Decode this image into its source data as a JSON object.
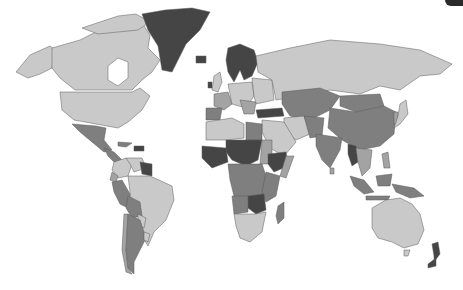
{
  "map": {
    "type": "choropleth world map",
    "colorscale": {
      "levels": [
        {
          "name": "level-1-lightest",
          "color": "#c9c9c9"
        },
        {
          "name": "level-2",
          "color": "#a3a3a3"
        },
        {
          "name": "level-3",
          "color": "#7f7f7f"
        },
        {
          "name": "level-4-darkest",
          "color": "#454545"
        }
      ],
      "ocean": "#ffffff",
      "border": "#5a5a5a"
    },
    "regions": [
      {
        "name": "Canada",
        "level": 1
      },
      {
        "name": "United States",
        "level": 1
      },
      {
        "name": "Alaska",
        "level": 1
      },
      {
        "name": "Greenland",
        "level": 4
      },
      {
        "name": "Iceland",
        "level": 4
      },
      {
        "name": "Mexico",
        "level": 3
      },
      {
        "name": "Central America",
        "level": 3
      },
      {
        "name": "Cuba",
        "level": 3
      },
      {
        "name": "Haiti / Dominican Republic",
        "level": 4
      },
      {
        "name": "Venezuela",
        "level": 2
      },
      {
        "name": "Colombia",
        "level": 1
      },
      {
        "name": "Guyana / Suriname",
        "level": 4
      },
      {
        "name": "Brazil",
        "level": 1
      },
      {
        "name": "Peru",
        "level": 3
      },
      {
        "name": "Ecuador",
        "level": 2
      },
      {
        "name": "Bolivia",
        "level": 3
      },
      {
        "name": "Paraguay",
        "level": 1
      },
      {
        "name": "Chile",
        "level": 2
      },
      {
        "name": "Argentina",
        "level": 3
      },
      {
        "name": "Uruguay",
        "level": 1
      },
      {
        "name": "Norway / Sweden / Finland",
        "level": 4
      },
      {
        "name": "United Kingdom",
        "level": 1
      },
      {
        "name": "Ireland",
        "level": 4
      },
      {
        "name": "France",
        "level": 2
      },
      {
        "name": "Spain",
        "level": 3
      },
      {
        "name": "Germany / Central Europe",
        "level": 1
      },
      {
        "name": "Eastern Europe",
        "level": 1
      },
      {
        "name": "Turkey",
        "level": 4
      },
      {
        "name": "Russia",
        "level": 1
      },
      {
        "name": "Kazakhstan / Central Asia",
        "level": 3
      },
      {
        "name": "Mongolia",
        "level": 3
      },
      {
        "name": "China",
        "level": 3
      },
      {
        "name": "India",
        "level": 3
      },
      {
        "name": "Iran",
        "level": 1
      },
      {
        "name": "Saudi Arabia",
        "level": 1
      },
      {
        "name": "Myanmar",
        "level": 4
      },
      {
        "name": "Southeast Asia",
        "level": 2
      },
      {
        "name": "Japan",
        "level": 1
      },
      {
        "name": "Indonesia",
        "level": 3
      },
      {
        "name": "Papua New Guinea",
        "level": 3
      },
      {
        "name": "Australia",
        "level": 1
      },
      {
        "name": "New Zealand",
        "level": 4
      },
      {
        "name": "North Africa (Maghreb)",
        "level": 1
      },
      {
        "name": "Egypt",
        "level": 2
      },
      {
        "name": "Sahel (Niger / Chad / Mali)",
        "level": 4
      },
      {
        "name": "West Africa coast",
        "level": 4
      },
      {
        "name": "Sudan",
        "level": 2
      },
      {
        "name": "Ethiopia",
        "level": 4
      },
      {
        "name": "Central Africa",
        "level": 3
      },
      {
        "name": "East Africa",
        "level": 3
      },
      {
        "name": "Zambia / Zimbabwe",
        "level": 4
      },
      {
        "name": "Southern Africa",
        "level": 1
      },
      {
        "name": "Madagascar",
        "level": 3
      }
    ]
  }
}
